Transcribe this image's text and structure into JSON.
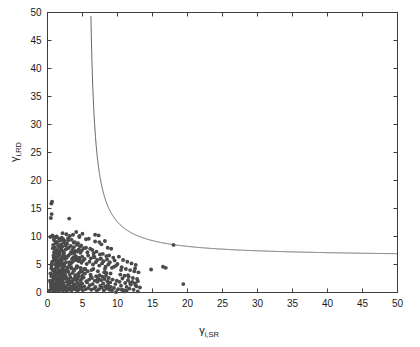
{
  "figure": {
    "background_color": "#ffffff",
    "axis_color": "#3d3d3d",
    "marker_color": "#4a4a4a",
    "curve_color": "#555555"
  },
  "chart_data": {
    "type": "scatter",
    "title": "",
    "xlabel": "γ_i,SR",
    "ylabel": "γ_i,RD",
    "xlabel_base": "γ",
    "xlabel_sub": "i,SR",
    "ylabel_base": "γ",
    "ylabel_sub": "i,RD",
    "xlim": [
      0,
      50
    ],
    "ylim": [
      0,
      50
    ],
    "xticks": [
      0,
      5,
      10,
      15,
      20,
      25,
      30,
      35,
      40,
      45,
      50
    ],
    "yticks": [
      0,
      5,
      10,
      15,
      20,
      25,
      30,
      35,
      40,
      45,
      50
    ],
    "xticklabels": [
      "0",
      "5",
      "10",
      "15",
      "20",
      "25",
      "30",
      "35",
      "40",
      "45",
      "50"
    ],
    "yticklabels": [
      "0",
      "5",
      "10",
      "15",
      "20",
      "25",
      "30",
      "35",
      "40",
      "45",
      "50"
    ],
    "grid": false,
    "legend": false,
    "legend_position": "none",
    "marker": "filled-circle",
    "marker_size_px": 3.0,
    "series": [
      {
        "name": "outage threshold curve",
        "type": "line",
        "description": "hyperbolic boundary with vertical asymptote near x=5.6 and horizontal asymptote near y=6.3",
        "asymptote_x": 5.6,
        "asymptote_y": 6.3,
        "model": "y = a + b/(x - c)",
        "a": 6.3,
        "b": 28.0,
        "c": 5.55,
        "points": [
          [
            5.62,
            50.0
          ],
          [
            5.65,
            45.0
          ],
          [
            5.7,
            40.0
          ],
          [
            5.75,
            36.0
          ],
          [
            5.8,
            32.0
          ],
          [
            5.9,
            28.0
          ],
          [
            6.0,
            25.5
          ],
          [
            6.1,
            23.5
          ],
          [
            6.3,
            21.0
          ],
          [
            6.5,
            19.2
          ],
          [
            6.8,
            17.3
          ],
          [
            7.0,
            16.6
          ],
          [
            7.3,
            14.9
          ],
          [
            7.6,
            19.0
          ],
          [
            8.0,
            13.7
          ],
          [
            8.5,
            12.8
          ],
          [
            9.0,
            12.4
          ],
          [
            9.5,
            11.4
          ],
          [
            10.0,
            10.6
          ],
          [
            11.0,
            9.9
          ],
          [
            12.0,
            9.6
          ],
          [
            13.0,
            9.0
          ],
          [
            14.0,
            8.7
          ],
          [
            15.0,
            8.5
          ],
          [
            16.5,
            8.2
          ],
          [
            18.0,
            8.0
          ],
          [
            20.0,
            7.6
          ],
          [
            22.5,
            7.35
          ],
          [
            25.0,
            7.2
          ],
          [
            28.0,
            7.0
          ],
          [
            31.0,
            6.85
          ],
          [
            34.0,
            6.75
          ],
          [
            38.0,
            6.6
          ],
          [
            42.0,
            6.5
          ],
          [
            46.0,
            6.42
          ],
          [
            50.0,
            6.35
          ]
        ]
      },
      {
        "name": "relay channel samples",
        "type": "scatter",
        "n_points": 420,
        "x": [
          0.35,
          0.42,
          0.51,
          0.58,
          0.62,
          0.67,
          0.71,
          0.75,
          0.79,
          0.83,
          0.88,
          0.92,
          0.95,
          0.99,
          1.02,
          1.06,
          1.1,
          1.14,
          1.18,
          1.22,
          1.26,
          1.3,
          1.34,
          1.38,
          1.42,
          1.46,
          1.5,
          1.54,
          1.58,
          1.62,
          1.66,
          1.7,
          1.74,
          1.78,
          1.82,
          1.86,
          1.9,
          1.94,
          1.98,
          2.02,
          2.06,
          2.1,
          2.14,
          2.18,
          2.22,
          2.26,
          2.3,
          2.34,
          2.38,
          2.42,
          0.4,
          0.48,
          0.55,
          0.6,
          0.65,
          0.7,
          0.76,
          0.81,
          0.86,
          0.9,
          0.94,
          0.98,
          1.03,
          1.08,
          1.12,
          1.16,
          1.2,
          1.24,
          1.28,
          1.32,
          1.36,
          1.4,
          1.44,
          1.48,
          1.52,
          1.56,
          1.6,
          1.64,
          1.68,
          1.72,
          1.76,
          1.8,
          1.84,
          1.88,
          1.92,
          1.96,
          2.0,
          2.04,
          2.08,
          2.12,
          2.16,
          2.2,
          2.24,
          2.28,
          2.32,
          2.36,
          2.4,
          2.45,
          2.5,
          2.55,
          2.6,
          2.65,
          2.7,
          2.75,
          2.8,
          2.85,
          2.9,
          2.95,
          3.0,
          3.05,
          3.1,
          3.15,
          3.2,
          3.25,
          3.3,
          3.35,
          3.4,
          3.45,
          3.5,
          3.55,
          3.6,
          3.65,
          3.7,
          3.75,
          3.8,
          3.85,
          3.9,
          3.95,
          4.0,
          4.05,
          4.1,
          4.15,
          4.2,
          4.25,
          4.3,
          4.35,
          4.4,
          4.45,
          4.5,
          4.55,
          4.6,
          4.65,
          4.7,
          4.75,
          4.8,
          4.85,
          4.9,
          4.95,
          5.0,
          5.1,
          5.2,
          5.3,
          5.4,
          5.5,
          5.6,
          5.7,
          5.8,
          5.9,
          6.0,
          6.1,
          6.2,
          6.3,
          6.4,
          6.5,
          6.6,
          6.7,
          6.8,
          6.9,
          7.0,
          7.1,
          7.2,
          7.3,
          7.4,
          7.5,
          7.6,
          7.7,
          7.8,
          7.9,
          8.0,
          8.1,
          8.2,
          8.3,
          8.4,
          8.5,
          8.6,
          8.7,
          8.8,
          8.9,
          9.0,
          9.1,
          9.2,
          9.4,
          9.6,
          9.8,
          10.0,
          10.2,
          10.4,
          10.6,
          10.8,
          11.0,
          11.2,
          11.4,
          11.6,
          11.8,
          12.0,
          12.2,
          12.4,
          12.6,
          12.8,
          13.0,
          0.3,
          0.45,
          0.5,
          0.56,
          0.63,
          0.68,
          0.73,
          0.78,
          0.84,
          0.89,
          0.93,
          0.97,
          1.01,
          1.05,
          1.09,
          1.13,
          1.17,
          1.21,
          1.25,
          1.29,
          1.33,
          1.37,
          1.41,
          1.45,
          1.49,
          1.53,
          1.57,
          1.61,
          1.65,
          1.69,
          1.73,
          1.77,
          1.81,
          1.85,
          1.89,
          1.93,
          1.97,
          2.01,
          2.05,
          2.09,
          2.13,
          2.17,
          2.21,
          2.25,
          2.29,
          2.33,
          2.37,
          2.41,
          2.47,
          2.52,
          2.58,
          2.63,
          2.68,
          2.73,
          2.78,
          2.83,
          2.88,
          2.93,
          2.98,
          3.03,
          3.08,
          3.13,
          3.18,
          3.23,
          3.28,
          3.33,
          3.38,
          3.43,
          3.48,
          3.53,
          3.58,
          3.63,
          3.68,
          3.73,
          3.78,
          3.83,
          3.88,
          3.93,
          3.98,
          4.03,
          4.08,
          4.13,
          4.18,
          4.23,
          4.28,
          4.33,
          4.38,
          4.43,
          4.48,
          4.53,
          4.58,
          4.63,
          4.68,
          4.73,
          4.78,
          4.83,
          4.88,
          4.93,
          4.98,
          5.05,
          5.15,
          5.25,
          5.35,
          5.45,
          5.55,
          5.65,
          5.75,
          5.85,
          5.95,
          6.05,
          6.15,
          6.25,
          6.35,
          6.45,
          6.55,
          6.65,
          6.75,
          6.85,
          6.95,
          7.05,
          7.15,
          7.25,
          7.35,
          7.45,
          7.55,
          7.65,
          7.75,
          7.85,
          7.95,
          8.05,
          8.15,
          8.25,
          8.35,
          8.45,
          8.55,
          8.65,
          8.75,
          8.85,
          8.95,
          9.05,
          9.3,
          9.5,
          9.7,
          9.9,
          10.1,
          10.3,
          10.5,
          10.7,
          10.9,
          11.1,
          11.3,
          11.5,
          11.7,
          11.9,
          12.1,
          12.3,
          12.5,
          12.7,
          12.9,
          13.2,
          0.55,
          0.8,
          1.15,
          1.35,
          1.55,
          1.75,
          2.15,
          2.55,
          2.95,
          3.35,
          3.75,
          4.15,
          4.55,
          4.95,
          5.5,
          6.2,
          6.8,
          7.4,
          8.2,
          9.5,
          10.5,
          11.5,
          12.5,
          14.8,
          16.5,
          16.9,
          18.0,
          19.4,
          10.9,
          11.3,
          0.6,
          1.05,
          1.45,
          1.95,
          2.45,
          3.15,
          3.65,
          4.35,
          5.25,
          6.6,
          7.6,
          8.4,
          9.2,
          9.8,
          10.6,
          11.8,
          12.6,
          12.9,
          7.2,
          8.6
        ],
        "y": [
          2.1,
          3.4,
          1.2,
          4.8,
          0.6,
          5.5,
          2.8,
          1.9,
          3.9,
          0.4,
          6.2,
          2.3,
          4.1,
          1.5,
          3.1,
          0.9,
          5.0,
          2.6,
          1.1,
          4.4,
          3.6,
          0.7,
          2.0,
          5.8,
          1.6,
          3.3,
          0.5,
          4.6,
          2.4,
          1.3,
          3.8,
          0.8,
          5.2,
          2.7,
          1.8,
          4.0,
          3.0,
          0.6,
          2.2,
          5.4,
          1.4,
          3.5,
          0.9,
          4.3,
          2.9,
          1.0,
          3.7,
          0.5,
          4.9,
          2.5,
          9.9,
          13.3,
          15.9,
          14.0,
          16.2,
          10.2,
          7.9,
          8.5,
          6.6,
          9.4,
          7.2,
          5.9,
          8.1,
          6.1,
          9.1,
          7.5,
          5.6,
          8.8,
          6.9,
          10.0,
          7.6,
          5.3,
          9.0,
          6.4,
          8.3,
          7.0,
          5.1,
          9.6,
          6.7,
          8.0,
          7.3,
          4.9,
          9.3,
          6.0,
          8.6,
          7.8,
          5.7,
          9.8,
          6.3,
          8.2,
          7.4,
          5.2,
          9.5,
          6.8,
          8.9,
          7.1,
          4.7,
          9.2,
          6.5,
          8.4,
          7.7,
          5.4,
          10.4,
          6.2,
          8.7,
          7.9,
          4.5,
          9.7,
          6.6,
          8.0,
          13.2,
          5.0,
          10.1,
          6.9,
          8.3,
          7.2,
          4.3,
          9.4,
          6.0,
          7.6,
          5.5,
          10.3,
          6.3,
          8.1,
          7.0,
          4.1,
          9.0,
          5.8,
          7.4,
          6.5,
          10.8,
          6.1,
          8.5,
          7.3,
          4.6,
          8.8,
          5.6,
          7.7,
          6.2,
          9.9,
          5.9,
          8.2,
          7.1,
          4.4,
          8.4,
          5.3,
          7.5,
          6.4,
          10.5,
          5.7,
          7.9,
          6.0,
          4.2,
          8.0,
          5.1,
          7.2,
          6.6,
          9.6,
          5.5,
          7.8,
          6.1,
          4.0,
          7.6,
          5.0,
          7.0,
          6.3,
          9.1,
          5.4,
          7.3,
          5.8,
          3.8,
          10.2,
          4.8,
          6.8,
          6.0,
          8.6,
          5.2,
          6.9,
          5.6,
          3.6,
          9.2,
          4.6,
          6.5,
          5.9,
          8.0,
          5.0,
          6.6,
          5.4,
          3.4,
          7.8,
          4.4,
          6.2,
          5.7,
          4.8,
          5.1,
          6.4,
          3.2,
          4.5,
          5.8,
          3.0,
          4.2,
          5.5,
          2.8,
          4.0,
          5.2,
          2.6,
          3.8,
          4.9,
          2.4,
          3.6,
          0.3,
          1.7,
          0.8,
          2.9,
          1.1,
          3.2,
          0.5,
          2.2,
          1.4,
          3.9,
          0.7,
          2.5,
          1.0,
          3.6,
          0.4,
          2.8,
          1.3,
          4.2,
          0.6,
          3.1,
          1.8,
          0.9,
          2.4,
          1.2,
          3.5,
          0.3,
          2.0,
          1.6,
          4.0,
          0.8,
          2.7,
          1.1,
          3.3,
          0.5,
          2.1,
          1.5,
          3.8,
          0.7,
          2.9,
          1.3,
          4.4,
          0.4,
          2.3,
          1.7,
          3.0,
          0.9,
          2.6,
          1.2,
          0.6,
          3.4,
          1.0,
          2.8,
          0.3,
          1.9,
          4.1,
          0.8,
          2.4,
          1.4,
          3.7,
          0.5,
          2.1,
          1.6,
          3.2,
          0.7,
          2.7,
          1.1,
          4.5,
          0.4,
          2.0,
          1.8,
          3.5,
          0.9,
          2.3,
          1.3,
          3.9,
          0.6,
          2.6,
          1.5,
          3.1,
          0.8,
          2.2,
          1.0,
          4.7,
          0.3,
          2.5,
          1.7,
          3.3,
          0.5,
          2.9,
          1.2,
          3.6,
          0.7,
          2.1,
          1.4,
          4.0,
          0.9,
          2.4,
          1.6,
          3.0,
          0.4,
          2.7,
          1.1,
          3.4,
          0.6,
          2.0,
          1.8,
          3.8,
          0.8,
          2.3,
          1.3,
          3.2,
          0.5,
          2.6,
          1.5,
          4.2,
          0.7,
          2.1,
          1.0,
          2.9,
          0.3,
          1.9,
          2.5,
          0.6,
          3.1,
          1.2,
          2.2,
          0.9,
          2.8,
          1.6,
          0.4,
          2.4,
          1.1,
          3.0,
          0.7,
          2.0,
          1.4,
          2.6,
          0.5,
          1.8,
          1.0,
          2.3,
          0.8,
          1.5,
          2.1,
          0.6,
          1.9,
          1.2,
          2.5,
          0.4,
          1.7,
          1.0,
          2.2,
          0.7,
          1.4,
          1.9,
          0.5,
          1.6,
          1.1,
          2.0,
          0.9,
          4.3,
          10.0,
          9.8,
          4.7,
          5.6,
          6.8,
          10.6,
          3.9,
          9.3,
          5.2,
          8.9,
          4.4,
          10.1,
          3.7,
          9.5,
          2.8,
          10.3,
          9.0,
          4.2,
          4.6,
          4.0,
          3.1,
          4.3,
          4.1,
          4.6,
          4.4,
          8.5,
          1.5,
          0.2,
          0.3,
          5.1,
          6.3,
          7.2,
          4.9,
          6.0,
          5.4,
          7.1,
          5.8,
          4.2,
          6.5,
          6.1,
          3.5,
          0.4,
          0.1,
          0.5,
          1.7,
          1.3,
          0.2,
          2.3,
          1.0
        ]
      }
    ]
  }
}
